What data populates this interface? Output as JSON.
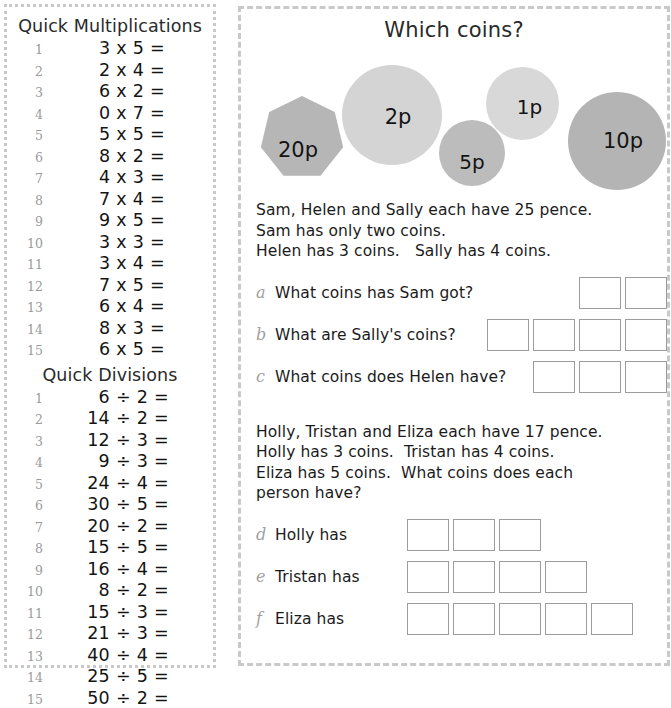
{
  "left_panel": {
    "multiplications": {
      "title": "Quick Multiplications",
      "rows": [
        {
          "n": "1",
          "expr": "3 x 5 ="
        },
        {
          "n": "2",
          "expr": "2 x 4 ="
        },
        {
          "n": "3",
          "expr": "6 x 2 ="
        },
        {
          "n": "4",
          "expr": "0 x 7 ="
        },
        {
          "n": "5",
          "expr": "5 x 5 ="
        },
        {
          "n": "6",
          "expr": "8 x 2 ="
        },
        {
          "n": "7",
          "expr": "4 x 3 ="
        },
        {
          "n": "8",
          "expr": "7 x 4 ="
        },
        {
          "n": "9",
          "expr": "9 x 5 ="
        },
        {
          "n": "10",
          "expr": "3 x 3 ="
        },
        {
          "n": "11",
          "expr": "3 x 4 ="
        },
        {
          "n": "12",
          "expr": "7 x 5 ="
        },
        {
          "n": "13",
          "expr": "6 x 4 ="
        },
        {
          "n": "14",
          "expr": "8 x 3 ="
        },
        {
          "n": "15",
          "expr": "6 x 5 ="
        }
      ]
    },
    "divisions": {
      "title": "Quick Divisions",
      "rows": [
        {
          "n": "1",
          "expr": "6 ÷ 2 ="
        },
        {
          "n": "2",
          "expr": "14 ÷ 2 ="
        },
        {
          "n": "3",
          "expr": "12 ÷ 3 ="
        },
        {
          "n": "4",
          "expr": "9 ÷ 3 ="
        },
        {
          "n": "5",
          "expr": "24 ÷ 4 ="
        },
        {
          "n": "6",
          "expr": "30 ÷ 5 ="
        },
        {
          "n": "7",
          "expr": "20 ÷ 2 ="
        },
        {
          "n": "8",
          "expr": "15 ÷ 5 ="
        },
        {
          "n": "9",
          "expr": "16 ÷ 4 ="
        },
        {
          "n": "10",
          "expr": "8 ÷ 2 ="
        },
        {
          "n": "11",
          "expr": "15 ÷ 3 ="
        },
        {
          "n": "12",
          "expr": "21 ÷ 3 ="
        },
        {
          "n": "13",
          "expr": "40 ÷ 4 ="
        },
        {
          "n": "14",
          "expr": "25 ÷ 5 ="
        },
        {
          "n": "15",
          "expr": "50 ÷ 2 ="
        }
      ]
    }
  },
  "right_panel": {
    "title": "Which coins?",
    "coins": [
      {
        "label": "20p",
        "shape": "heptagon",
        "color": "#b6b6b6"
      },
      {
        "label": "2p",
        "shape": "circle",
        "color": "#d4d4d4"
      },
      {
        "label": "5p",
        "shape": "circle",
        "color": "#bcbcbc"
      },
      {
        "label": "1p",
        "shape": "circle",
        "color": "#d8d8d8"
      },
      {
        "label": "10p",
        "shape": "circle",
        "color": "#b4b4b4"
      }
    ],
    "problem_1": {
      "lines": [
        "Sam, Helen and Sally each have 25 pence.",
        "Sam has only two coins.",
        "Helen has 3 coins.   Sally has 4 coins."
      ],
      "questions": [
        {
          "letter": "a",
          "text": "What coins has Sam got?",
          "boxes": 2
        },
        {
          "letter": "b",
          "text": "What are Sally's coins?",
          "boxes": 4
        },
        {
          "letter": "c",
          "text": "What coins does Helen have?",
          "boxes": 3
        }
      ]
    },
    "problem_2": {
      "lines": [
        "Holly, Tristan and Eliza each have 17 pence.",
        "Holly has 3 coins.  Tristan has 4 coins.",
        "Eliza has 5 coins.  What coins does each",
        "person have?"
      ],
      "questions": [
        {
          "letter": "d",
          "text": "Holly has",
          "boxes": 3
        },
        {
          "letter": "e",
          "text": "Tristan has",
          "boxes": 4
        },
        {
          "letter": "f",
          "text": "Eliza has",
          "boxes": 5
        }
      ]
    }
  }
}
